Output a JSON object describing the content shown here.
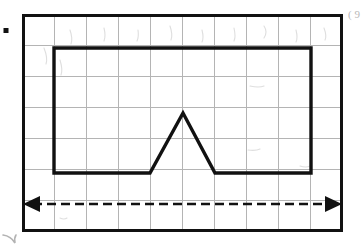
{
  "figure": {
    "canvas": {
      "width": 363,
      "height": 252,
      "background": "#ffffff"
    },
    "colors": {
      "grid": "#b4b4b4",
      "outline": "#111111",
      "dimension": "#111111",
      "pencil_marks": "#a8a8a8"
    },
    "grid": {
      "label": "square grid",
      "x0": 22,
      "y0": 14,
      "x1": 343,
      "y1": 232,
      "columns": 10,
      "rows": 7,
      "cell_width": 32.1,
      "cell_height": 31.1,
      "outer_border_visible": true,
      "grid_visible": true
    },
    "outline_shape": {
      "name": "house-like polygon",
      "description": "Large rectangle spanning 8 columns by 4 rows with a triangular notch rising from its base in the middle",
      "units": "grid cells",
      "points_px": [
        [
          54,
          48
        ],
        [
          311,
          48
        ],
        [
          311,
          173
        ],
        [
          215,
          173
        ],
        [
          183,
          113
        ],
        [
          150,
          173
        ],
        [
          54,
          173
        ]
      ],
      "closed": true,
      "rectangle": {
        "left": 54,
        "top": 48,
        "right": 311,
        "bottom": 173,
        "width_cells": 8,
        "height_cells": 4
      },
      "triangle": {
        "apex_px": [
          183,
          113
        ],
        "base_left_px": [
          150,
          173
        ],
        "base_right_px": [
          215,
          173
        ],
        "base_cells": 2,
        "height_cells": 2
      }
    },
    "dimension_arrow": {
      "name": "width dimension arrow",
      "style": "double-headed dashed",
      "y_px": 204,
      "x_start_px": 23,
      "x_end_px": 342,
      "span_cells": 10,
      "dash_pattern": "9 5",
      "label": ""
    },
    "annotations": [
      {
        "name": "bullet-dot",
        "type": "square-dot",
        "x": 5,
        "y": 30,
        "size": 5
      },
      {
        "name": "corner-pencil-mark",
        "type": "stroke",
        "x": 4,
        "y": 236,
        "text": ""
      },
      {
        "name": "margin-pencil-mark",
        "type": "text",
        "x": 350,
        "y": 16,
        "text": "( 9"
      }
    ]
  }
}
